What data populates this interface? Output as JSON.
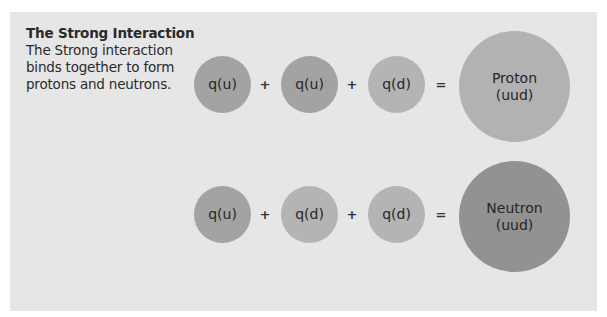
{
  "intro": {
    "title": "The Strong Interaction",
    "body_lines": [
      "The Strong interaction",
      "binds together to form",
      "protons and neutrons."
    ]
  },
  "colors": {
    "background": "#e6e6e6",
    "up_quark": "#a3a3a3",
    "down_quark": "#b4b4b4",
    "proton": "#b2b2b2",
    "neutron": "#929292",
    "text": "#2a2a2a"
  },
  "equations": [
    {
      "terms": [
        "q(u)",
        "q(u)",
        "q(d)"
      ],
      "operators": [
        "+",
        "+",
        "="
      ],
      "result": {
        "name": "Proton",
        "composition": "(uud)"
      }
    },
    {
      "terms": [
        "q(u)",
        "q(d)",
        "q(d)"
      ],
      "operators": [
        "+",
        "+",
        "="
      ],
      "result": {
        "name": "Neutron",
        "composition": "(uud)"
      }
    }
  ]
}
